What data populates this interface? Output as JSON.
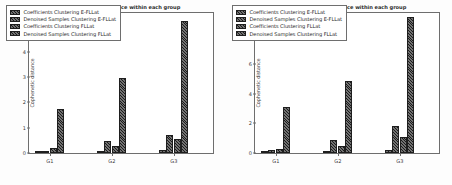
{
  "figure": {
    "background_color": "#ffffff",
    "bar_color": "#3b3b3b",
    "bar_edge_color": "#1e1e1e",
    "axis_color": "#6e6e6e",
    "text_color": "#2b2b2b"
  },
  "chart_data": [
    {
      "type": "bar",
      "panel": "left",
      "title": "Average cophenetic distance within each group",
      "xlabel": "",
      "ylabel": "Cophenetic distance",
      "categories": [
        "G1",
        "G2",
        "G3"
      ],
      "yticks": [
        0,
        1,
        2,
        3,
        4,
        5
      ],
      "ylim": [
        0,
        5.6
      ],
      "grid": false,
      "legend_position": "upper left",
      "series": [
        {
          "name": "Coefficients Clustering  E-FLLat",
          "values": [
            0.02,
            0.08,
            0.12
          ]
        },
        {
          "name": "Denoised Samples Clustering E-FLLat",
          "values": [
            0.05,
            0.48,
            0.72
          ]
        },
        {
          "name": "Coefficients Clustering FLLat",
          "values": [
            0.2,
            0.27,
            0.55
          ]
        },
        {
          "name": "Denoised Samples Clustering FLLat",
          "values": [
            1.73,
            2.96,
            5.2
          ]
        }
      ]
    },
    {
      "type": "bar",
      "panel": "right",
      "title": "Average cophenetic distance within each group",
      "xlabel": "",
      "ylabel": "Cophenetic distance",
      "categories": [
        "G1",
        "G2",
        "G3"
      ],
      "yticks": [
        0,
        2,
        4,
        6,
        8
      ],
      "ylim": [
        0,
        9.6
      ],
      "grid": false,
      "legend_position": "upper left",
      "series": [
        {
          "name": "Coefficients Clustering  E-FLLat",
          "values": [
            0.05,
            0.1,
            0.2
          ]
        },
        {
          "name": "Denoised Samples Clustering E-FLLat",
          "values": [
            0.2,
            0.9,
            1.8
          ]
        },
        {
          "name": "Coefficients Clustering FLLat",
          "values": [
            0.3,
            0.5,
            1.05
          ]
        },
        {
          "name": "Denoised Samples Clustering FLLat",
          "values": [
            3.1,
            4.9,
            9.2
          ]
        }
      ]
    }
  ]
}
